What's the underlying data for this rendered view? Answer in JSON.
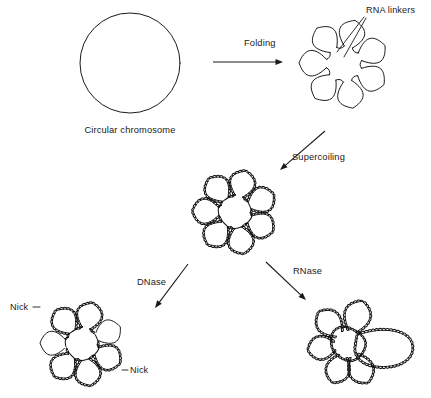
{
  "figure": {
    "background_color": "#ffffff",
    "ink_color": "#1a1a1a",
    "width": 431,
    "height": 398
  },
  "stages": [
    {
      "id": "circular-chromosome",
      "label": "Circular chromosome",
      "label_x": 130,
      "label_y": 133,
      "shape": "circle",
      "cx": 130,
      "cy": 63,
      "r": 50,
      "supercoiled": false,
      "loops": 0
    },
    {
      "id": "folded-rosette",
      "label": "",
      "shape": "rosette",
      "cx": 344,
      "cy": 64,
      "core_r": 18,
      "petal_len": 27,
      "petal_w": 15,
      "loops": 7,
      "supercoiled": false
    },
    {
      "id": "supercoiled-rosette",
      "label": "",
      "shape": "rosette",
      "cx": 235,
      "cy": 212,
      "core_r": 17,
      "petal_len": 25,
      "petal_w": 14,
      "loops": 7,
      "supercoiled": true
    },
    {
      "id": "dnase-product",
      "label": "",
      "shape": "rosette",
      "cx": 82,
      "cy": 344,
      "core_r": 17,
      "petal_len": 25,
      "petal_w": 14,
      "loops": 7,
      "supercoiled": true,
      "relaxed_loop_indices": [
        5,
        1
      ]
    },
    {
      "id": "rnase-product",
      "label": "",
      "shape": "fused-rosette",
      "cx": 348,
      "cy": 344,
      "core_r": 16,
      "loops": 6,
      "supercoiled": true
    }
  ],
  "annotations": [
    {
      "id": "rna-linkers",
      "text": "RNA linkers",
      "x": 366,
      "y": 13,
      "anchor": "start",
      "leaders": [
        {
          "x1": 364,
          "y1": 17,
          "x2": 337,
          "y2": 52
        },
        {
          "x1": 366,
          "y1": 18,
          "x2": 344,
          "y2": 57
        }
      ]
    },
    {
      "id": "nick-upper-left",
      "text": "Nick",
      "x": 10,
      "y": 310,
      "anchor": "start",
      "leaders": [
        {
          "x1": 33,
          "y1": 307,
          "x2": 40,
          "y2": 307
        }
      ]
    },
    {
      "id": "nick-lower-right",
      "text": "Nick",
      "x": 130,
      "y": 373,
      "anchor": "start",
      "leaders": [
        {
          "x1": 122,
          "y1": 370,
          "x2": 128,
          "y2": 370
        }
      ]
    }
  ],
  "transitions": [
    {
      "id": "folding",
      "label": "Folding",
      "label_x": 244,
      "label_y": 46,
      "x1": 213,
      "y1": 62,
      "x2": 283,
      "y2": 62,
      "direction": "right"
    },
    {
      "id": "supercoiling",
      "label": "Supercoiling",
      "label_x": 292,
      "label_y": 160,
      "x1": 325,
      "y1": 131,
      "x2": 280,
      "y2": 170,
      "direction": "down-left"
    },
    {
      "id": "dnase",
      "label": "DNase",
      "label_x": 137,
      "label_y": 285,
      "x1": 188,
      "y1": 264,
      "x2": 155,
      "y2": 308,
      "direction": "down-left"
    },
    {
      "id": "rnase",
      "label": "RNase",
      "label_x": 293,
      "label_y": 274,
      "x1": 266,
      "y1": 262,
      "x2": 306,
      "y2": 300,
      "direction": "down-right"
    }
  ]
}
